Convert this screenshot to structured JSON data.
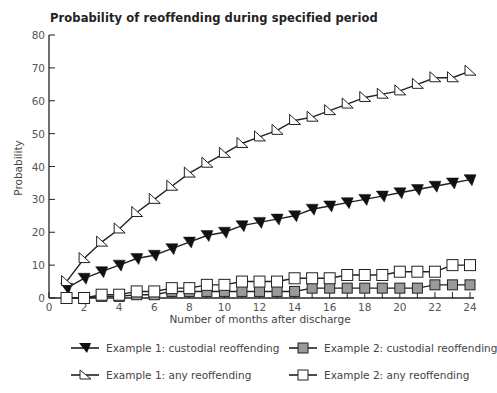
{
  "chart_data": {
    "type": "line",
    "title": "Probability of reoffending during specified period",
    "xlabel": "Number of months after discharge",
    "ylabel": "Probability",
    "xlim": [
      0,
      24
    ],
    "ylim": [
      0,
      80
    ],
    "xticks": [
      0,
      2,
      4,
      6,
      8,
      10,
      12,
      14,
      16,
      18,
      20,
      22,
      24
    ],
    "yticks": [
      0,
      10,
      20,
      30,
      40,
      50,
      60,
      70,
      80
    ],
    "grid": false,
    "legend_position": "bottom",
    "x": [
      1,
      2,
      3,
      4,
      5,
      6,
      7,
      8,
      9,
      10,
      11,
      12,
      13,
      14,
      15,
      16,
      17,
      18,
      19,
      20,
      21,
      22,
      23,
      24
    ],
    "series": [
      {
        "name": "Example 1: custodial reoffending",
        "marker": "filled-triangle-down",
        "color": "#111111",
        "values": [
          3,
          6,
          8,
          10,
          12,
          13,
          15,
          17,
          19,
          20,
          22,
          23,
          24,
          25,
          27,
          28,
          29,
          30,
          31,
          32,
          33,
          34,
          35,
          36
        ]
      },
      {
        "name": "Example 2: custodial reoffending",
        "marker": "grey-square",
        "color": "#9a9a9a",
        "values": [
          0,
          0,
          0.5,
          0.5,
          1,
          1,
          2,
          2,
          2,
          2,
          2,
          2,
          2,
          2,
          3,
          3,
          3,
          3,
          3,
          3,
          3,
          4,
          4,
          4
        ]
      },
      {
        "name": "Example 1: any reoffending",
        "marker": "open-triangle",
        "color": "#ffffff",
        "values": [
          5,
          12,
          17,
          21,
          26,
          30,
          34,
          38,
          41,
          44,
          47,
          49,
          51,
          54,
          55,
          57,
          59,
          61,
          62,
          63,
          65,
          67,
          67,
          69
        ]
      },
      {
        "name": "Example 2: any reoffending",
        "marker": "open-square",
        "color": "#ffffff",
        "values": [
          0,
          0,
          1,
          1,
          2,
          2,
          3,
          3,
          4,
          4,
          5,
          5,
          5,
          6,
          6,
          6,
          7,
          7,
          7,
          8,
          8,
          8,
          10,
          10
        ]
      }
    ]
  },
  "legend": {
    "items": [
      {
        "label": "Example 1: custodial reoffending"
      },
      {
        "label": "Example 2: custodial reoffending"
      },
      {
        "label": "Example 1: any reoffending"
      },
      {
        "label": "Example 2: any reoffending"
      }
    ]
  }
}
